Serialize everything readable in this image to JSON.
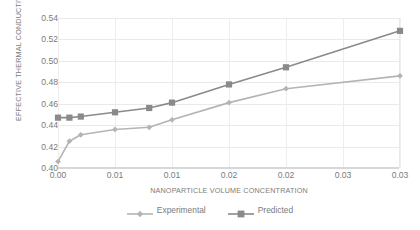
{
  "chart_data": {
    "type": "line",
    "title": "",
    "xlabel": "NANOPARTICLE VOLUME CONCENTRATION",
    "ylabel": "EFFECTIVE THERMAL CONDUCTIVITY",
    "x": [
      0.0,
      0.001,
      0.002,
      0.005,
      0.008,
      0.01,
      0.015,
      0.02,
      0.03
    ],
    "xlim": [
      0.0,
      0.03
    ],
    "ylim": [
      0.4,
      0.54
    ],
    "x_tick_values": [
      0.0,
      0.005,
      0.01,
      0.015,
      0.02,
      0.025,
      0.03
    ],
    "x_tick_labels": [
      "0.00",
      "0.01",
      "0.01",
      "0.02",
      "0.02",
      "0.03",
      "0.03"
    ],
    "y_tick_values": [
      0.4,
      0.42,
      0.44,
      0.46,
      0.48,
      0.5,
      0.52,
      0.54
    ],
    "y_tick_labels": [
      "0.40",
      "0.42",
      "0.44",
      "0.46",
      "0.48",
      "0.50",
      "0.52",
      "0.54"
    ],
    "grid": true,
    "legend_position": "bottom",
    "series": [
      {
        "name": "Experimental",
        "color": "#b4b4b4",
        "marker": "diamond",
        "values": [
          0.406,
          0.425,
          0.431,
          0.436,
          0.438,
          0.445,
          0.461,
          0.474,
          0.486
        ]
      },
      {
        "name": "Predicted",
        "color": "#8a8a8a",
        "marker": "square",
        "values": [
          0.447,
          0.447,
          0.448,
          0.452,
          0.456,
          0.461,
          0.478,
          0.494,
          0.528
        ]
      }
    ]
  },
  "legend": {
    "items": [
      {
        "label": "Experimental"
      },
      {
        "label": "Predicted"
      }
    ]
  }
}
